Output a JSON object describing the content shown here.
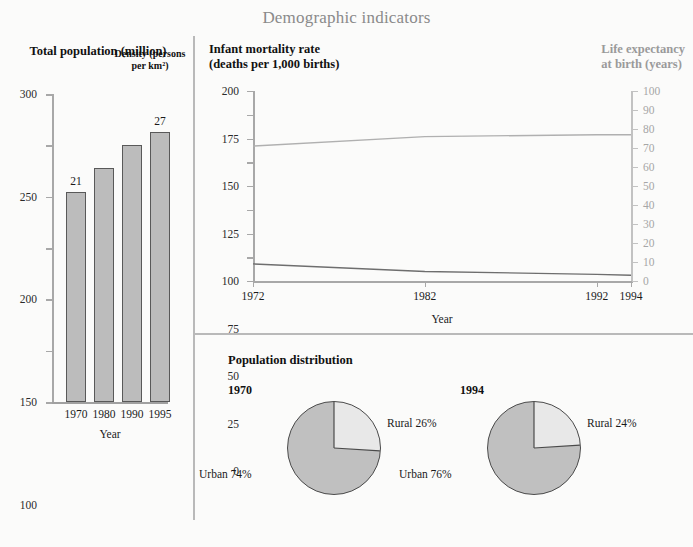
{
  "page": {
    "title": "Demographic indicators",
    "title_color": "#8a8a8a",
    "background": "#fbfbfa"
  },
  "chart_data": [
    {
      "type": "bar",
      "title": "Total population (million)",
      "xlabel": "Year",
      "ylabel": "",
      "categories": [
        "1970",
        "1980",
        "1990",
        "1995"
      ],
      "values": [
        205,
        228,
        250,
        263
      ],
      "ylim": [
        0,
        300
      ],
      "yticks": [
        0,
        50,
        100,
        150,
        200,
        250,
        300
      ],
      "grid": false,
      "annotations": [
        {
          "label": "21",
          "category": "1970"
        },
        {
          "label": "27",
          "category": "1995"
        }
      ],
      "annotation_title": "Density (persons per km²)",
      "bar_fill": "#bcbcbc",
      "bar_stroke": "#595959"
    },
    {
      "type": "line",
      "title": "Infant mortality rate (deaths per 1,000 births)",
      "title_right": "Life expectancy at birth (years)",
      "xlabel": "Year",
      "x": [
        1972,
        1982,
        1992,
        1994
      ],
      "xticks": [
        "1972",
        "1982",
        "1992",
        "1994"
      ],
      "xlim": [
        1972,
        1994
      ],
      "ylim": [
        0,
        200
      ],
      "yticks": [
        0,
        25,
        50,
        75,
        100,
        125,
        150,
        175,
        200
      ],
      "ylim_right": [
        0,
        100
      ],
      "yticks_right": [
        0,
        10,
        20,
        30,
        40,
        50,
        60,
        70,
        80,
        90,
        100
      ],
      "grid": false,
      "series": [
        {
          "name": "Infant mortality rate",
          "axis": "left",
          "values": [
            18,
            10,
            7,
            6
          ],
          "color": "#6e6e6e"
        },
        {
          "name": "Life expectancy at birth",
          "axis": "right",
          "values": [
            71,
            76,
            77,
            77
          ],
          "color": "#b0b0b0"
        }
      ]
    },
    {
      "type": "pie",
      "title": "Population distribution",
      "charts": [
        {
          "year": "1970",
          "labels": [
            "Rural 26%",
            "Urban 74%"
          ],
          "values": [
            26,
            74
          ],
          "colors": [
            "#e8e8e8",
            "#c0c0c0"
          ]
        },
        {
          "year": "1994",
          "labels": [
            "Rural 24%",
            "Urban 76%"
          ],
          "values": [
            24,
            76
          ],
          "colors": [
            "#e8e8e8",
            "#c0c0c0"
          ]
        }
      ]
    }
  ],
  "bar_panel": {
    "title": "Total population (million)",
    "axis_caption": "Year",
    "density_note": "Density (persons per km²)",
    "yticks": [
      "300",
      "250",
      "200",
      "150",
      "100",
      "50",
      "0"
    ],
    "xlabels": [
      "1970",
      "1980",
      "1990",
      "1995"
    ],
    "values": [
      "21",
      "27"
    ]
  },
  "line_panel": {
    "title_line1": "Infant mortality rate",
    "title_line2": "(deaths per 1,000 births)",
    "title_right_line1": "Life expectancy",
    "title_right_line2": "at birth (years)",
    "axis_caption": "Year",
    "yticks_left": [
      "200",
      "175",
      "150",
      "125",
      "100",
      "75",
      "50",
      "25",
      "0"
    ],
    "yticks_right": [
      "100",
      "90",
      "80",
      "70",
      "60",
      "50",
      "40",
      "30",
      "20",
      "10",
      "0"
    ],
    "xticks": [
      "1972",
      "1982",
      "1992",
      "1994"
    ]
  },
  "pie_panel": {
    "title": "Population distribution",
    "pies": [
      {
        "year": "1970",
        "rural_label": "Rural 26%",
        "urban_label": "Urban 74%"
      },
      {
        "year": "1994",
        "rural_label": "Rural 24%",
        "urban_label": "Urban 76%"
      }
    ]
  }
}
